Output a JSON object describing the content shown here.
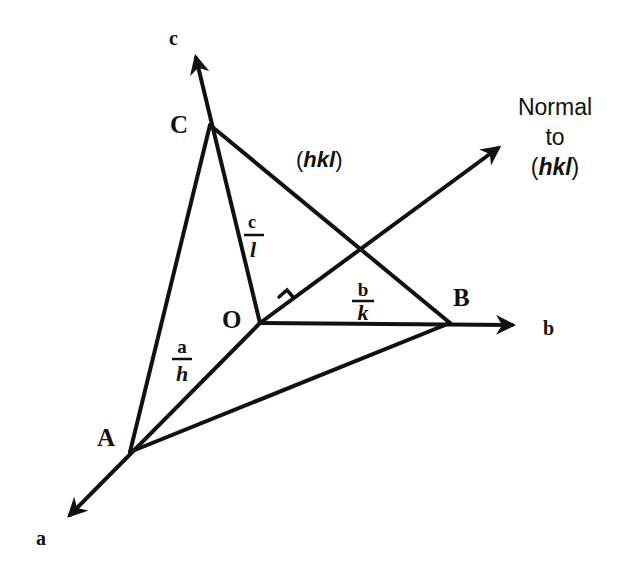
{
  "diagram": {
    "axes": {
      "a": {
        "label": "a"
      },
      "b": {
        "label": "b"
      },
      "c": {
        "label": "c"
      }
    },
    "points": {
      "origin": {
        "label": "O"
      },
      "A": {
        "label": "A"
      },
      "B": {
        "label": "B"
      },
      "C": {
        "label": "C"
      }
    },
    "intercepts": {
      "a_over_h": {
        "numerator": "a",
        "denominator": "h"
      },
      "b_over_k": {
        "numerator": "b",
        "denominator": "k"
      },
      "c_over_l": {
        "numerator": "c",
        "denominator": "l"
      }
    },
    "plane_label": {
      "open": "(",
      "indices": "hkl",
      "close": ")"
    },
    "normal_label": {
      "line1": "Normal",
      "line2": "to",
      "open": "(",
      "indices": "hkl",
      "close": ")"
    },
    "right_angle_marker": "right-angle"
  }
}
